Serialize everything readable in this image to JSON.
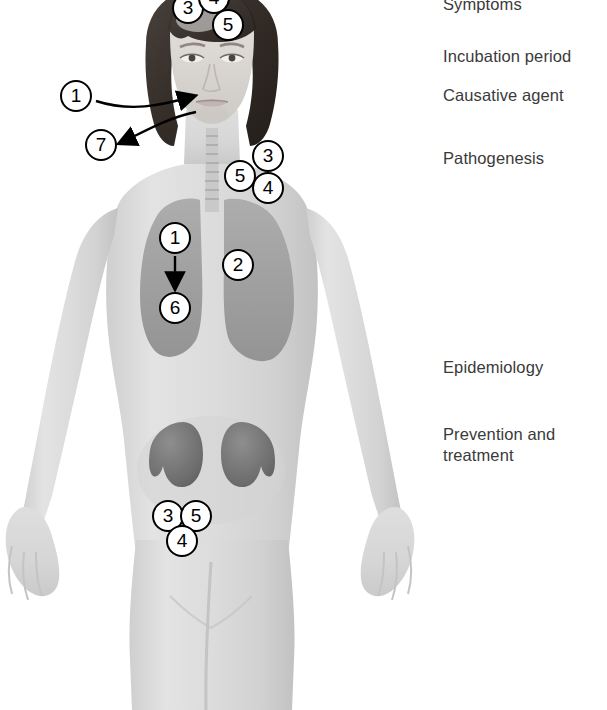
{
  "figure": {
    "width": 607,
    "height": 710,
    "background_color": "#ffffff",
    "marker_text_color": "#000000",
    "marker_fill_color": "#ffffff",
    "legend_text_color": "#3a3a3a"
  },
  "legend": {
    "items": [
      {
        "label": "Symptoms",
        "x": 443,
        "y": -6,
        "clipped": true
      },
      {
        "label": "Incubation period",
        "x": 443,
        "y": 46,
        "clipped": false
      },
      {
        "label": "Causative agent",
        "x": 443,
        "y": 85,
        "clipped": false
      },
      {
        "label": "Pathogenesis",
        "x": 443,
        "y": 148,
        "clipped": false
      },
      {
        "label": "Epidemiology",
        "x": 443,
        "y": 357,
        "clipped": false
      },
      {
        "label": "Prevention and\ntreatment",
        "x": 443,
        "y": 424,
        "clipped": false
      }
    ]
  },
  "markers": [
    {
      "number": "3",
      "x": 172,
      "y": -8,
      "region": "forehead",
      "clipped": true
    },
    {
      "number": "4",
      "x": 198,
      "y": -18,
      "region": "forehead",
      "clipped": true
    },
    {
      "number": "5",
      "x": 212,
      "y": 9,
      "region": "forehead",
      "clipped": false
    },
    {
      "number": "1",
      "x": 60,
      "y": 80,
      "region": "face-callout",
      "clipped": false
    },
    {
      "number": "7",
      "x": 85,
      "y": 129,
      "region": "face-callout",
      "clipped": false
    },
    {
      "number": "3",
      "x": 252,
      "y": 140,
      "region": "neck-shoulder",
      "clipped": false
    },
    {
      "number": "5",
      "x": 224,
      "y": 160,
      "region": "neck-shoulder",
      "clipped": false
    },
    {
      "number": "4",
      "x": 252,
      "y": 172,
      "region": "neck-shoulder",
      "clipped": false
    },
    {
      "number": "1",
      "x": 159,
      "y": 222,
      "region": "lung-left",
      "clipped": false
    },
    {
      "number": "2",
      "x": 222,
      "y": 249,
      "region": "lung-right",
      "clipped": false
    },
    {
      "number": "6",
      "x": 159,
      "y": 292,
      "region": "lung-left",
      "clipped": false
    },
    {
      "number": "3",
      "x": 152,
      "y": 500,
      "region": "kidney",
      "clipped": false
    },
    {
      "number": "5",
      "x": 180,
      "y": 500,
      "region": "kidney",
      "clipped": false
    },
    {
      "number": "4",
      "x": 166,
      "y": 525,
      "region": "kidney",
      "clipped": false
    }
  ],
  "anatomy": {
    "body_tone": "#d9d9d9",
    "hair_color": "#3f3833",
    "organ_tone": "#a8a8a8",
    "lung_tone": "#9e9e9e",
    "kidney_tone": "#707070",
    "parts": [
      {
        "name": "head",
        "label": "Head and face"
      },
      {
        "name": "hair",
        "label": "Hair"
      },
      {
        "name": "neck",
        "label": "Neck and trachea"
      },
      {
        "name": "torso",
        "label": "Torso"
      },
      {
        "name": "lungs",
        "label": "Lungs"
      },
      {
        "name": "kidneys",
        "label": "Kidneys"
      },
      {
        "name": "arms",
        "label": "Arms and hands"
      },
      {
        "name": "legs",
        "label": "Legs"
      }
    ]
  },
  "arrows": [
    {
      "name": "arrow-1-to-face",
      "from_marker": "1",
      "to_region": "mouth"
    },
    {
      "name": "arrow-7-from-face",
      "from_marker": "7",
      "to_region": "marker-7"
    },
    {
      "name": "arrow-1-to-6",
      "from_marker": "1",
      "to_region": "marker-6"
    }
  ]
}
